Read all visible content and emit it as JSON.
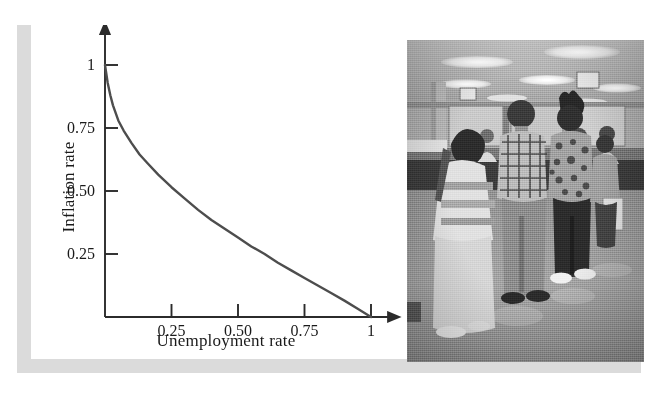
{
  "figure": {
    "kind": "textbook-figure",
    "panels": [
      "phillips-curve-chart",
      "unemployment-office-photograph"
    ]
  },
  "chart_data": {
    "type": "line",
    "title": "",
    "subtitle": "",
    "xlabel": "Unemployment rate",
    "ylabel": "Inflation rate",
    "xlim": [
      0,
      1.08
    ],
    "ylim": [
      0,
      1.08
    ],
    "xticks": [
      0.25,
      0.5,
      0.75,
      1
    ],
    "xtick_labels": [
      "0.25",
      "0.50",
      "0.75",
      "1"
    ],
    "yticks": [
      0.25,
      0.5,
      0.75,
      1
    ],
    "ytick_labels": [
      "0.25",
      "0.50",
      "0.75",
      "1"
    ],
    "grid": false,
    "legend": "none",
    "axis_style": "arrow-headed-open-axes",
    "series": [
      {
        "name": "Phillips curve",
        "color": "#4d4d4d",
        "x": [
          0.0,
          0.01,
          0.02,
          0.03,
          0.05,
          0.07,
          0.1,
          0.13,
          0.16,
          0.2,
          0.25,
          0.3,
          0.35,
          0.4,
          0.45,
          0.5,
          0.55,
          0.6,
          0.65,
          0.7,
          0.75,
          0.8,
          0.85,
          0.9,
          0.95,
          1.0
        ],
        "y": [
          1.0,
          0.93,
          0.88,
          0.84,
          0.78,
          0.74,
          0.69,
          0.645,
          0.61,
          0.565,
          0.515,
          0.47,
          0.425,
          0.385,
          0.35,
          0.315,
          0.28,
          0.25,
          0.215,
          0.185,
          0.155,
          0.125,
          0.095,
          0.065,
          0.033,
          0.0
        ]
      }
    ]
  },
  "axes": {
    "y_title": "Inflation rate",
    "x_title": "Unemployment rate",
    "y_tick_labels": [
      {
        "value": 1,
        "text": "1"
      },
      {
        "value": 0.75,
        "text": "0.75"
      },
      {
        "value": 0.5,
        "text": "0.50"
      },
      {
        "value": 0.25,
        "text": "0.25"
      }
    ],
    "x_tick_labels": [
      {
        "value": 0.25,
        "text": "0.25"
      },
      {
        "value": 0.5,
        "text": "0.50"
      },
      {
        "value": 0.75,
        "text": "0.75"
      },
      {
        "value": 1,
        "text": "1"
      }
    ]
  },
  "photo": {
    "alt": "Black and white photograph of people waiting in line at an unemployment office counter",
    "scene": "unemployment-office-queue",
    "palette": {
      "floor": "#9a9a9a",
      "ceiling": "#b9b9b9",
      "counter": "#4a4a4a",
      "wall": "#a8a8a8"
    }
  },
  "colors": {
    "curve": "#4d4d4d",
    "axis": "#2b2b2b",
    "text": "#1a1a1a",
    "shadow_band": "#dbdbdb",
    "page_background": "#ffffff"
  }
}
